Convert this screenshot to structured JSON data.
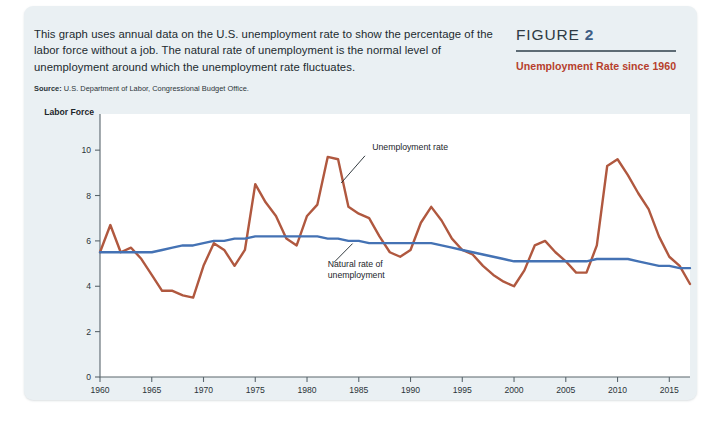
{
  "panel": {
    "background_color": "#eaf0f3"
  },
  "intro": {
    "text": "This graph uses annual data on the U.S. unemployment rate to show the percentage of the labor force without a job. The natural rate of unemployment is the normal level of unemployment around which the unemployment rate fluctuates.",
    "source_label": "Source:",
    "source_text": "U.S. Department of Labor, Congressional Budget Office."
  },
  "figure_header": {
    "label": "FIGURE",
    "number": "2",
    "subtitle": "Unemployment Rate since 1960",
    "number_color": "#3f5f86",
    "subtitle_color": "#b6402c"
  },
  "chart_data": {
    "type": "line",
    "title": "Unemployment Rate since 1960",
    "xlabel": "",
    "ylabel": "Percent of Labor Force",
    "ylabel_lines": [
      "Percent of",
      "Labor Force"
    ],
    "xlim": [
      1960,
      2017
    ],
    "ylim": [
      0,
      10.8
    ],
    "yticks": [
      0,
      2,
      4,
      6,
      8,
      10
    ],
    "ytick_labels": [
      "0",
      "2",
      "4",
      "6",
      "8",
      "10"
    ],
    "xticks": [
      1960,
      1965,
      1970,
      1975,
      1980,
      1985,
      1990,
      1995,
      2000,
      2005,
      2010,
      2015
    ],
    "xtick_labels": [
      "1960",
      "1965",
      "1970",
      "1975",
      "1980",
      "1985",
      "1990",
      "1995",
      "2000",
      "2005",
      "2010",
      "2015"
    ],
    "grid": false,
    "legend": "annotations",
    "x": [
      1960,
      1961,
      1962,
      1963,
      1964,
      1965,
      1966,
      1967,
      1968,
      1969,
      1970,
      1971,
      1972,
      1973,
      1974,
      1975,
      1976,
      1977,
      1978,
      1979,
      1980,
      1981,
      1982,
      1983,
      1984,
      1985,
      1986,
      1987,
      1988,
      1989,
      1990,
      1991,
      1992,
      1993,
      1994,
      1995,
      1996,
      1997,
      1998,
      1999,
      2000,
      2001,
      2002,
      2003,
      2004,
      2005,
      2006,
      2007,
      2008,
      2009,
      2010,
      2011,
      2012,
      2013,
      2014,
      2015,
      2016,
      2017
    ],
    "series": [
      {
        "name": "Unemployment rate",
        "color": "#b0583f",
        "width": 2.4,
        "values": [
          5.5,
          6.7,
          5.5,
          5.7,
          5.2,
          4.5,
          3.8,
          3.8,
          3.6,
          3.5,
          4.9,
          5.9,
          5.6,
          4.9,
          5.6,
          8.5,
          7.7,
          7.1,
          6.1,
          5.8,
          7.1,
          7.6,
          9.7,
          9.6,
          7.5,
          7.2,
          7.0,
          6.2,
          5.5,
          5.3,
          5.6,
          6.8,
          7.5,
          6.9,
          6.1,
          5.6,
          5.4,
          4.9,
          4.5,
          4.2,
          4.0,
          4.7,
          5.8,
          6.0,
          5.5,
          5.1,
          4.6,
          4.6,
          5.8,
          9.3,
          9.6,
          8.9,
          8.1,
          7.4,
          6.2,
          5.3,
          4.9,
          4.1
        ]
      },
      {
        "name": "Natural rate of unemployment",
        "color": "#4472b4",
        "width": 2.4,
        "values": [
          5.5,
          5.5,
          5.5,
          5.5,
          5.5,
          5.5,
          5.6,
          5.7,
          5.8,
          5.8,
          5.9,
          6.0,
          6.0,
          6.1,
          6.1,
          6.2,
          6.2,
          6.2,
          6.2,
          6.2,
          6.2,
          6.2,
          6.1,
          6.1,
          6.0,
          6.0,
          5.9,
          5.9,
          5.9,
          5.9,
          5.9,
          5.9,
          5.9,
          5.8,
          5.7,
          5.6,
          5.5,
          5.4,
          5.3,
          5.2,
          5.1,
          5.1,
          5.1,
          5.1,
          5.1,
          5.1,
          5.1,
          5.1,
          5.2,
          5.2,
          5.2,
          5.2,
          5.1,
          5.0,
          4.9,
          4.9,
          4.8,
          4.8
        ]
      }
    ],
    "annotations": [
      {
        "text": "Unemployment rate",
        "lines": [
          "Unemployment rate"
        ],
        "x": 1986.3,
        "y": 10.0,
        "leader_from": [
          1985.6,
          9.75
        ],
        "leader_to": [
          1983.3,
          8.55
        ]
      },
      {
        "text": "Natural rate of unemployment",
        "lines": [
          "Natural rate of",
          "unemployment"
        ],
        "x": 1982.0,
        "y": 4.85,
        "leader_from": [
          1982.6,
          5.05
        ],
        "leader_to": [
          1984.4,
          5.88
        ]
      }
    ]
  }
}
